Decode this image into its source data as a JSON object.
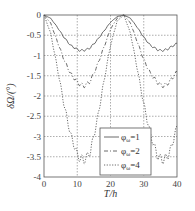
{
  "chart_data": {
    "type": "line",
    "title": "",
    "xlabel": "T/h",
    "ylabel": "δΩ/(°)",
    "xlim": [
      0,
      40
    ],
    "ylim": [
      -4,
      0
    ],
    "xticks": [
      0,
      10,
      20,
      30,
      40
    ],
    "yticks": [
      0,
      -0.5,
      -1,
      -1.5,
      -2,
      -2.5,
      -3,
      -3.5,
      -4
    ],
    "xtick_labels": [
      "0",
      "10",
      "20",
      "30",
      "40"
    ],
    "ytick_labels": [
      "0",
      "-0.5",
      "-1",
      "-1.5",
      "-2",
      "-2.5",
      "-3",
      "-3.5",
      "-4"
    ],
    "grid": true,
    "legend_position": "lower right",
    "x": [
      0,
      2,
      4,
      6,
      8,
      10,
      11,
      12,
      13,
      14,
      16,
      18,
      20,
      22,
      24,
      26,
      28,
      30,
      32,
      34,
      35,
      36,
      37,
      38,
      40
    ],
    "series": [
      {
        "name": "φω=1",
        "label_main": "φ",
        "label_sub": "ω",
        "label_val": "=1",
        "style": "solid",
        "values": [
          0,
          -0.08,
          -0.3,
          -0.55,
          -0.75,
          -0.85,
          -0.88,
          -0.87,
          -0.85,
          -0.8,
          -0.62,
          -0.4,
          -0.18,
          -0.04,
          0,
          -0.08,
          -0.3,
          -0.55,
          -0.75,
          -0.85,
          -0.88,
          -0.87,
          -0.85,
          -0.8,
          -0.7
        ]
      },
      {
        "name": "φω=2",
        "label_main": "φ",
        "label_sub": "ω",
        "label_val": "=2",
        "style": "dashdot",
        "values": [
          0,
          -0.2,
          -0.65,
          -1.1,
          -1.45,
          -1.65,
          -1.72,
          -1.75,
          -1.7,
          -1.62,
          -1.25,
          -0.8,
          -0.35,
          -0.08,
          0,
          -0.2,
          -0.65,
          -1.1,
          -1.45,
          -1.65,
          -1.72,
          -1.75,
          -1.7,
          -1.62,
          -1.4
        ]
      },
      {
        "name": "φω=4",
        "label_main": "φ",
        "label_sub": "ω",
        "label_val": "=4",
        "style": "dotted",
        "values": [
          0,
          -0.45,
          -1.3,
          -2.2,
          -2.95,
          -3.45,
          -3.55,
          -3.58,
          -3.5,
          -3.35,
          -2.6,
          -1.65,
          -0.75,
          -0.15,
          0,
          -0.45,
          -1.3,
          -2.2,
          -2.95,
          -3.45,
          -3.55,
          -3.58,
          -3.5,
          -3.35,
          -2.75
        ]
      }
    ]
  }
}
